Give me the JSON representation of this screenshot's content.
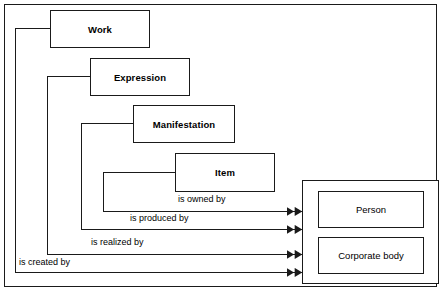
{
  "diagram": {
    "type": "entity-relationship-diagram",
    "frame_color": "#1a1a1a",
    "background_color": "#ffffff",
    "line_color": "#1a1a1a",
    "arrowhead_style": "double-solid-triangle"
  },
  "entities": {
    "group1": [
      {
        "id": "work",
        "label": "Work"
      },
      {
        "id": "expression",
        "label": "Expression"
      },
      {
        "id": "manifestation",
        "label": "Manifestation"
      },
      {
        "id": "item",
        "label": "Item"
      }
    ],
    "group2": [
      {
        "id": "person",
        "label": "Person"
      },
      {
        "id": "corporate-body",
        "label": "Corporate body"
      }
    ]
  },
  "relationships": [
    {
      "id": "is-owned-by",
      "label": "is owned by",
      "from": "item",
      "to": "group2"
    },
    {
      "id": "is-produced-by",
      "label": "is produced by",
      "from": "manifestation",
      "to": "group2"
    },
    {
      "id": "is-realized-by",
      "label": "is realized by",
      "from": "expression",
      "to": "group2"
    },
    {
      "id": "is-created-by",
      "label": "is created by",
      "from": "work",
      "to": "group2"
    }
  ]
}
